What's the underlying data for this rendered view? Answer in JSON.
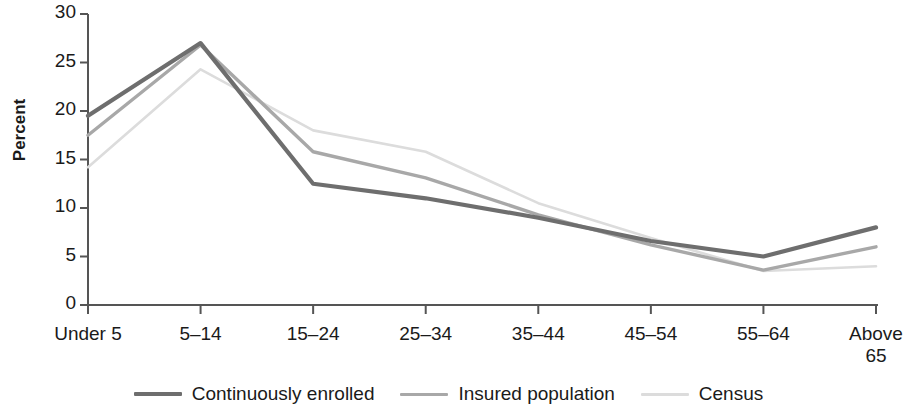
{
  "chart_data": {
    "type": "line",
    "title": "",
    "xlabel": "",
    "ylabel": "Percent",
    "categories": [
      "Under 5",
      "5–14",
      "15–24",
      "25–34",
      "35–44",
      "45–54",
      "55–64",
      "Above\n65"
    ],
    "ylim": [
      0,
      30
    ],
    "yticks": [
      0,
      5,
      10,
      15,
      20,
      25,
      30
    ],
    "ytick_labels": [
      "0",
      "5",
      "10",
      "15",
      "20",
      "25",
      "30"
    ],
    "grid": false,
    "legend_position": "bottom",
    "series": [
      {
        "name": "Continuously enrolled",
        "color": "#6e6e6e",
        "width": 4.2,
        "values": [
          19.5,
          27.0,
          12.5,
          11.0,
          9.0,
          6.6,
          5.0,
          8.0
        ]
      },
      {
        "name": "Insured population",
        "color": "#a8a8a8",
        "width": 3.4,
        "values": [
          17.5,
          26.8,
          15.8,
          13.1,
          9.3,
          6.2,
          3.6,
          6.0
        ]
      },
      {
        "name": "Census",
        "color": "#dcdcdc",
        "width": 2.6,
        "values": [
          14.2,
          24.3,
          18.0,
          15.8,
          10.5,
          6.9,
          3.5,
          4.0
        ]
      }
    ]
  },
  "axis": {
    "y_title": "Percent"
  },
  "legend": {
    "items": [
      {
        "label": "Continuously enrolled"
      },
      {
        "label": "Insured population"
      },
      {
        "label": "Census"
      }
    ]
  }
}
